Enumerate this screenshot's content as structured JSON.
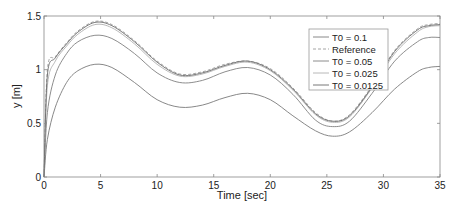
{
  "chart_data": {
    "type": "line",
    "title": "",
    "xlabel": "Time [sec]",
    "ylabel": "y [m]",
    "xlim": [
      0,
      35
    ],
    "ylim": [
      0,
      1.5
    ],
    "xticks": [
      0,
      5,
      10,
      15,
      20,
      25,
      30,
      35
    ],
    "yticks": [
      0,
      0.5,
      1,
      1.5
    ],
    "xtick_labels": [
      "0",
      "5",
      "10",
      "15",
      "20",
      "25",
      "30",
      "35"
    ],
    "ytick_labels": [
      "0",
      "0.5",
      "1",
      "1.5"
    ],
    "grid": false,
    "legend_position": "upper right (inside)",
    "x": [
      0,
      0.3,
      1,
      2,
      3,
      4.5,
      6,
      8,
      10,
      12,
      14,
      16,
      18,
      20,
      22,
      24,
      25.5,
      27,
      29,
      31,
      33,
      34,
      35
    ],
    "series": [
      {
        "name": "T0 = 0.1",
        "color": "#7a7a7a",
        "dash": "solid",
        "values": [
          0,
          0.35,
          0.65,
          0.88,
          0.99,
          1.05,
          1.02,
          0.88,
          0.72,
          0.65,
          0.67,
          0.74,
          0.78,
          0.72,
          0.57,
          0.43,
          0.38,
          0.42,
          0.6,
          0.82,
          0.98,
          1.02,
          1.03
        ]
      },
      {
        "name": "Reference",
        "color": "#9a9a9a",
        "dash": "dashed",
        "values": [
          0,
          1.0,
          1.12,
          1.25,
          1.36,
          1.45,
          1.42,
          1.27,
          1.08,
          0.96,
          0.98,
          1.05,
          1.08,
          1.01,
          0.83,
          0.6,
          0.52,
          0.58,
          0.85,
          1.18,
          1.38,
          1.42,
          1.43
        ]
      },
      {
        "name": "T0 = 0.05",
        "color": "#808080",
        "dash": "solid",
        "values": [
          0,
          0.6,
          0.95,
          1.15,
          1.26,
          1.32,
          1.29,
          1.15,
          0.97,
          0.88,
          0.9,
          0.98,
          1.02,
          0.95,
          0.77,
          0.53,
          0.47,
          0.52,
          0.78,
          1.08,
          1.26,
          1.3,
          1.3
        ]
      },
      {
        "name": "T0 = 0.025",
        "color": "#b0b0b0",
        "dash": "solid",
        "values": [
          0,
          0.85,
          1.08,
          1.22,
          1.33,
          1.42,
          1.39,
          1.24,
          1.05,
          0.94,
          0.96,
          1.03,
          1.07,
          0.99,
          0.81,
          0.58,
          0.51,
          0.56,
          0.83,
          1.15,
          1.35,
          1.4,
          1.41
        ]
      },
      {
        "name": "T0 = 0.0125",
        "color": "#6a6a6a",
        "dash": "solid",
        "values": [
          0,
          0.95,
          1.11,
          1.24,
          1.35,
          1.44,
          1.41,
          1.26,
          1.07,
          0.95,
          0.97,
          1.04,
          1.08,
          1.0,
          0.82,
          0.59,
          0.52,
          0.57,
          0.84,
          1.17,
          1.37,
          1.41,
          1.42
        ]
      }
    ]
  }
}
